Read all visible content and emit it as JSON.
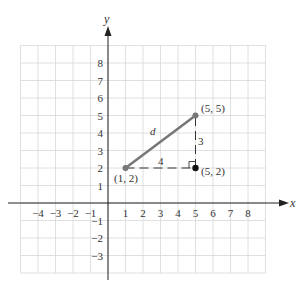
{
  "chart_data": {
    "type": "scatter",
    "title": "",
    "xlabel": "x",
    "ylabel": "y",
    "xlim": [
      -5,
      9
    ],
    "ylim": [
      -4,
      9
    ],
    "grid": true,
    "x_ticks": [
      "−4",
      "−3",
      "−2",
      "−1",
      "1",
      "2",
      "3",
      "4",
      "5",
      "6",
      "7",
      "8"
    ],
    "y_ticks": [
      "8",
      "7",
      "6",
      "5",
      "4",
      "3",
      "2",
      "1",
      "−1",
      "−2",
      "−3"
    ],
    "points": [
      {
        "x": 1,
        "y": 2,
        "label": "(1, 2)"
      },
      {
        "x": 5,
        "y": 5,
        "label": "(5, 5)"
      },
      {
        "x": 5,
        "y": 2,
        "label": "(5, 2)"
      }
    ],
    "segments": [
      {
        "from": [
          1,
          2
        ],
        "to": [
          5,
          5
        ],
        "style": "solid",
        "label": "d"
      },
      {
        "from": [
          1,
          2
        ],
        "to": [
          5,
          2
        ],
        "style": "dashed",
        "label": "4"
      },
      {
        "from": [
          5,
          2
        ],
        "to": [
          5,
          5
        ],
        "style": "dashed",
        "label": "3"
      }
    ],
    "annotations": [
      "right-angle marker at (5, 2)"
    ]
  },
  "labels": {
    "x_axis": "x",
    "y_axis": "y",
    "p1": "(1, 2)",
    "p2": "(5, 5)",
    "p3": "(5, 2)",
    "hyp": "d",
    "horiz": "4",
    "vert": "3"
  }
}
